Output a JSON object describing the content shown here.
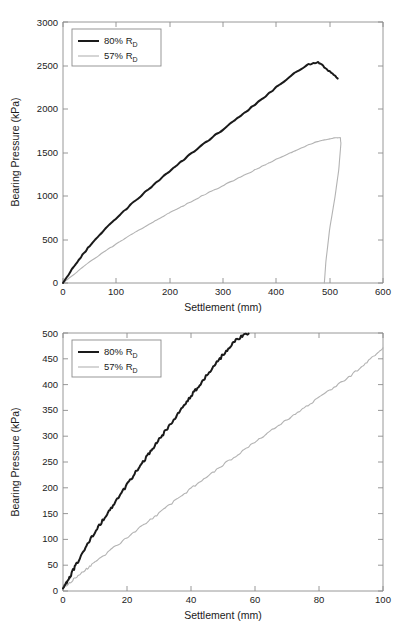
{
  "figure": {
    "title": "",
    "panels": [
      "top",
      "bottom"
    ]
  },
  "top_panel": {
    "xlabel": "Settlement (mm)",
    "ylabel": "Bearing Pressure (kPa)",
    "xticks": [
      "0",
      "100",
      "200",
      "300",
      "400",
      "500",
      "600"
    ],
    "yticks": [
      "0",
      "500",
      "1000",
      "1500",
      "2000",
      "2500",
      "3000"
    ],
    "legend": {
      "entries": [
        {
          "label_main": "80% R",
          "label_sub": "D",
          "color": "#1a1a1a"
        },
        {
          "label_main": "57% R",
          "label_sub": "D",
          "color": "#b3b3b3"
        }
      ]
    }
  },
  "bottom_panel": {
    "xlabel": "Settlement (mm)",
    "ylabel": "Bearing Pressure (kPa)",
    "xticks": [
      "0",
      "20",
      "40",
      "60",
      "80",
      "100"
    ],
    "yticks": [
      "0",
      "50",
      "100",
      "150",
      "200",
      "250",
      "300",
      "350",
      "400",
      "450",
      "500"
    ],
    "legend": {
      "entries": [
        {
          "label_main": "80% R",
          "label_sub": "D",
          "color": "#1a1a1a"
        },
        {
          "label_main": "57% R",
          "label_sub": "D",
          "color": "#b3b3b3"
        }
      ]
    }
  },
  "chart_data": [
    {
      "type": "line",
      "panel": "top",
      "title": "",
      "xlabel": "Settlement (mm)",
      "ylabel": "Bearing Pressure (kPa)",
      "xlim": [
        0,
        600
      ],
      "ylim": [
        0,
        3000
      ],
      "xtick_step": 100,
      "ytick_step": 500,
      "grid": false,
      "legend_position": "upper-left",
      "series": [
        {
          "name": "80% R_D",
          "color": "#1a1a1a",
          "x": [
            0,
            10,
            20,
            30,
            40,
            50,
            60,
            80,
            100,
            120,
            140,
            160,
            180,
            200,
            220,
            240,
            260,
            280,
            300,
            320,
            340,
            360,
            380,
            400,
            420,
            440,
            460,
            470,
            478,
            485,
            492,
            500,
            508,
            515
          ],
          "y": [
            0,
            95,
            185,
            270,
            350,
            425,
            495,
            625,
            745,
            860,
            970,
            1075,
            1180,
            1285,
            1385,
            1485,
            1580,
            1675,
            1765,
            1860,
            1955,
            2050,
            2150,
            2250,
            2345,
            2440,
            2510,
            2528,
            2535,
            2510,
            2470,
            2430,
            2390,
            2350
          ]
        },
        {
          "name": "57% R_D",
          "color": "#b3b3b3",
          "x": [
            0,
            20,
            40,
            60,
            80,
            100,
            120,
            140,
            160,
            180,
            200,
            220,
            240,
            260,
            280,
            300,
            320,
            340,
            360,
            380,
            400,
            420,
            440,
            460,
            480,
            500,
            512,
            520,
            521,
            517,
            510,
            500,
            493,
            490
          ],
          "y": [
            0,
            100,
            195,
            285,
            370,
            450,
            525,
            600,
            670,
            740,
            805,
            870,
            935,
            1000,
            1060,
            1120,
            1180,
            1240,
            1300,
            1360,
            1420,
            1480,
            1535,
            1585,
            1630,
            1660,
            1668,
            1670,
            1600,
            1300,
            990,
            620,
            250,
            0
          ]
        }
      ]
    },
    {
      "type": "line",
      "panel": "bottom",
      "title": "",
      "xlabel": "Settlement (mm)",
      "ylabel": "Bearing Pressure (kPa)",
      "xlim": [
        0,
        100
      ],
      "ylim": [
        0,
        500
      ],
      "xtick_step": 20,
      "ytick_step": 50,
      "grid": false,
      "legend_position": "upper-left",
      "series": [
        {
          "name": "80% R_D",
          "color": "#1a1a1a",
          "x": [
            0,
            1,
            2,
            3,
            4,
            6,
            8,
            10,
            12,
            14,
            16,
            18,
            20,
            22,
            24,
            26,
            28,
            30,
            32,
            34,
            36,
            38,
            40,
            42,
            44,
            46,
            48,
            50,
            52,
            54,
            56,
            58
          ],
          "y": [
            5,
            14,
            26,
            38,
            50,
            72,
            94,
            114,
            133,
            151,
            170,
            188,
            206,
            224,
            242,
            259,
            276,
            293,
            310,
            327,
            344,
            361,
            378,
            394,
            410,
            426,
            442,
            458,
            473,
            486,
            494,
            500
          ]
        },
        {
          "name": "57% R_D",
          "color": "#b3b3b3",
          "x": [
            0,
            2,
            4,
            6,
            8,
            10,
            14,
            18,
            22,
            26,
            30,
            34,
            38,
            42,
            46,
            50,
            54,
            58,
            62,
            66,
            70,
            74,
            78,
            82,
            86,
            90,
            94,
            97,
            100
          ],
          "y": [
            6,
            16,
            26,
            36,
            46,
            56,
            75,
            94,
            113,
            132,
            151,
            170,
            189,
            208,
            226,
            244,
            262,
            280,
            298,
            315,
            332,
            349,
            366,
            383,
            400,
            418,
            438,
            455,
            470
          ]
        }
      ]
    }
  ]
}
